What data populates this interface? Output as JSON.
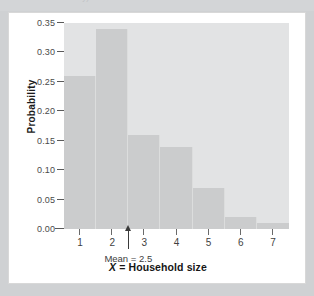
{
  "page": {
    "top_sliver_ghost_text": "the family)",
    "background_color": "#cfd1d3",
    "card_background_color": "#ffffff",
    "card_border_color": "#d8d8d8"
  },
  "chart_data": {
    "type": "bar",
    "title": "",
    "subtitle": "",
    "xlabel_prefix": "X",
    "xlabel_rest": " = Household size",
    "xlabel": "X = Household size",
    "ylabel": "Probability",
    "categories": [
      "1",
      "2",
      "3",
      "4",
      "5",
      "6",
      "7"
    ],
    "values": [
      0.26,
      0.34,
      0.16,
      0.14,
      0.07,
      0.02,
      0.01
    ],
    "xlim": [
      0.5,
      7.5
    ],
    "ylim": [
      0.0,
      0.35
    ],
    "ytick_values": [
      0.0,
      0.05,
      0.1,
      0.15,
      0.2,
      0.25,
      0.3,
      0.35
    ],
    "ytick_labels": [
      "0.00",
      "0.05",
      "0.10",
      "0.15",
      "0.20",
      "0.25",
      "0.30",
      "0.35"
    ],
    "xtick_labels": [
      "1",
      "2",
      "3",
      "4",
      "5",
      "6",
      "7"
    ],
    "grid": false,
    "legend": null,
    "legend_position": "none",
    "bar_color": "#cbcccd",
    "bar_edge_color": "#dcdddd",
    "plot_background_color": "#e2e3e4",
    "annotations": [
      {
        "name": "mean-marker",
        "label": "Mean = 2.5",
        "x": 2.5,
        "y": 0.0,
        "style": "up-arrow below axis",
        "color": "#3a3a3a"
      }
    ]
  }
}
